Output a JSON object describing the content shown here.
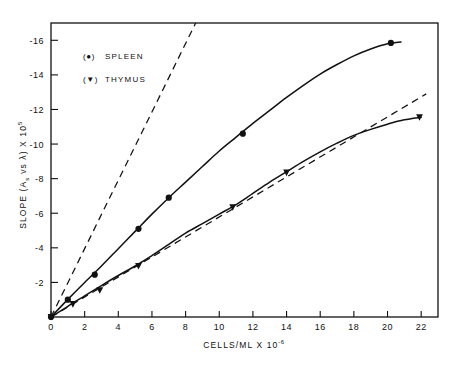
{
  "chart_data": {
    "type": "line",
    "title": "",
    "xlabel": "CELLS/ML X 10",
    "xlabel_exponent": "-6",
    "ylabel": "SLOPE (A",
    "ylabel_sub": "s",
    "ylabel_mid": " vs ",
    "ylabel_lambda": "λ",
    "ylabel_tail": ") X 10",
    "ylabel_exponent": "5",
    "xlim": [
      0,
      23
    ],
    "ylim": [
      0,
      -17
    ],
    "xticks": [
      "0",
      "2",
      "4",
      "6",
      "8",
      "10",
      "12",
      "14",
      "16",
      "18",
      "20",
      "22"
    ],
    "xtick_values": [
      0,
      2,
      4,
      6,
      8,
      10,
      12,
      14,
      16,
      18,
      20,
      22
    ],
    "yticks": [
      "-2",
      "-4",
      "-6",
      "-8",
      "-10",
      "-12",
      "-14",
      "-16"
    ],
    "ytick_values": [
      -2,
      -4,
      -6,
      -8,
      -10,
      -12,
      -14,
      -16
    ],
    "grid": false,
    "legend_position": "top-left",
    "legend": [
      {
        "symbol": "(●)",
        "label": "SPLEEN",
        "marker": "circle"
      },
      {
        "symbol": "(▼)",
        "label": "THYMUS",
        "marker": "triangle-down"
      }
    ],
    "series": [
      {
        "name": "SPLEEN",
        "marker": "circle",
        "style": "solid-curve",
        "points": [
          {
            "x": 0.0,
            "y": 0.0
          },
          {
            "x": 1.0,
            "y": -1.0
          },
          {
            "x": 2.6,
            "y": -2.45
          },
          {
            "x": 5.2,
            "y": -5.1
          },
          {
            "x": 7.0,
            "y": -6.9
          },
          {
            "x": 11.4,
            "y": -10.6
          },
          {
            "x": 20.2,
            "y": -15.85
          }
        ],
        "curve": [
          {
            "x": 0.0,
            "y": 0.0
          },
          {
            "x": 1.0,
            "y": -1.02
          },
          {
            "x": 2.0,
            "y": -2.0
          },
          {
            "x": 3.0,
            "y": -2.95
          },
          {
            "x": 4.0,
            "y": -3.95
          },
          {
            "x": 5.0,
            "y": -4.95
          },
          {
            "x": 6.0,
            "y": -5.95
          },
          {
            "x": 7.0,
            "y": -6.9
          },
          {
            "x": 8.0,
            "y": -7.8
          },
          {
            "x": 9.0,
            "y": -8.7
          },
          {
            "x": 10.0,
            "y": -9.6
          },
          {
            "x": 11.0,
            "y": -10.4
          },
          {
            "x": 12.0,
            "y": -11.2
          },
          {
            "x": 13.0,
            "y": -11.95
          },
          {
            "x": 14.0,
            "y": -12.7
          },
          {
            "x": 15.0,
            "y": -13.4
          },
          {
            "x": 16.0,
            "y": -14.05
          },
          {
            "x": 17.0,
            "y": -14.6
          },
          {
            "x": 18.0,
            "y": -15.1
          },
          {
            "x": 19.0,
            "y": -15.5
          },
          {
            "x": 20.0,
            "y": -15.8
          },
          {
            "x": 20.8,
            "y": -15.9
          }
        ],
        "tangent": [
          {
            "x": 0.0,
            "y": 0.0
          },
          {
            "x": 8.6,
            "y": -17.0
          }
        ]
      },
      {
        "name": "THYMUS",
        "marker": "triangle-down",
        "style": "solid-curve",
        "points": [
          {
            "x": 0.0,
            "y": 0.0
          },
          {
            "x": 1.3,
            "y": -0.75
          },
          {
            "x": 2.9,
            "y": -1.55
          },
          {
            "x": 5.2,
            "y": -2.95
          },
          {
            "x": 10.8,
            "y": -6.35
          },
          {
            "x": 14.0,
            "y": -8.35
          },
          {
            "x": 21.9,
            "y": -11.55
          }
        ],
        "curve": [
          {
            "x": 0.0,
            "y": 0.0
          },
          {
            "x": 1.0,
            "y": -0.62
          },
          {
            "x": 2.0,
            "y": -1.22
          },
          {
            "x": 3.0,
            "y": -1.82
          },
          {
            "x": 4.0,
            "y": -2.4
          },
          {
            "x": 5.0,
            "y": -2.95
          },
          {
            "x": 6.0,
            "y": -3.55
          },
          {
            "x": 7.0,
            "y": -4.2
          },
          {
            "x": 8.0,
            "y": -4.85
          },
          {
            "x": 9.0,
            "y": -5.4
          },
          {
            "x": 10.0,
            "y": -5.95
          },
          {
            "x": 11.0,
            "y": -6.5
          },
          {
            "x": 12.0,
            "y": -7.15
          },
          {
            "x": 13.0,
            "y": -7.8
          },
          {
            "x": 14.0,
            "y": -8.4
          },
          {
            "x": 15.0,
            "y": -9.0
          },
          {
            "x": 16.0,
            "y": -9.55
          },
          {
            "x": 17.0,
            "y": -10.05
          },
          {
            "x": 18.0,
            "y": -10.5
          },
          {
            "x": 19.0,
            "y": -10.85
          },
          {
            "x": 20.0,
            "y": -11.15
          },
          {
            "x": 21.0,
            "y": -11.4
          },
          {
            "x": 22.0,
            "y": -11.55
          }
        ],
        "tangent": [
          {
            "x": 0.0,
            "y": 0.0
          },
          {
            "x": 22.3,
            "y": -12.9
          }
        ]
      }
    ]
  }
}
